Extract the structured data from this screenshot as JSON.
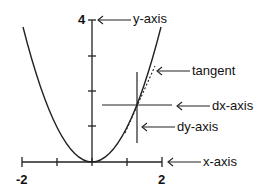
{
  "diagram": {
    "curve": "y = x^2",
    "x_range": [
      -2,
      2
    ],
    "y_range": [
      0,
      4
    ],
    "labels": {
      "y_axis": "y-axis",
      "x_axis": "x-axis",
      "tangent": "tangent",
      "dx_axis": "dx-axis",
      "dy_axis": "dy-axis"
    },
    "tick_labels": {
      "y_top": "4",
      "x_left": "-2",
      "x_right": "2"
    },
    "x_ticks": [
      -2,
      -1,
      0,
      1,
      2
    ],
    "y_ticks": [
      1,
      2,
      3,
      4
    ],
    "tangent_point": {
      "x": 1.27,
      "y": 1.6
    },
    "colors": {
      "line": "#222222",
      "background": "#ffffff"
    }
  }
}
